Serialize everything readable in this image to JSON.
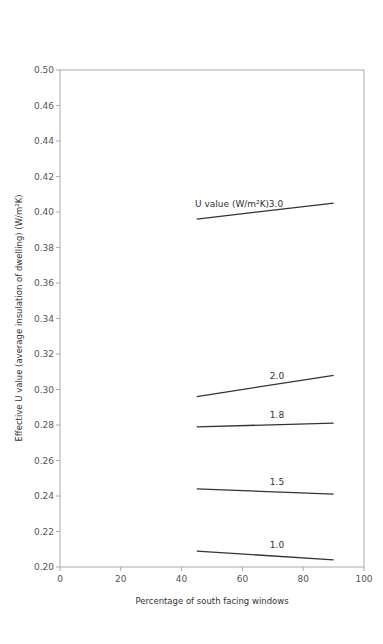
{
  "chart_data": {
    "type": "line",
    "title": "",
    "xlabel": "Percentage of south facing windows",
    "ylabel": "Effective U value (average insulation of dwelling) (W/m²K)",
    "xlim": [
      0,
      100
    ],
    "ylim": [
      0.2,
      0.48
    ],
    "x_ticks": [
      0,
      20,
      40,
      60,
      80,
      100
    ],
    "y_ticks": [
      {
        "value": 0.2,
        "label": "0.20"
      },
      {
        "value": 0.22,
        "label": "0.22"
      },
      {
        "value": 0.24,
        "label": "0.24"
      },
      {
        "value": 0.26,
        "label": "0.26"
      },
      {
        "value": 0.28,
        "label": "0.28"
      },
      {
        "value": 0.3,
        "label": "0.30"
      },
      {
        "value": 0.32,
        "label": "0.32"
      },
      {
        "value": 0.34,
        "label": "0.34"
      },
      {
        "value": 0.36,
        "label": "0.36"
      },
      {
        "value": 0.38,
        "label": "0.38"
      },
      {
        "value": 0.4,
        "label": "0.40"
      },
      {
        "value": 0.42,
        "label": "0.42"
      },
      {
        "value": 0.44,
        "label": "0.44"
      },
      {
        "value": 0.46,
        "label": "0.46"
      },
      {
        "value": 0.48,
        "label": "0.50"
      }
    ],
    "grid": false,
    "legend_title": "U value (W/m²K)",
    "series": [
      {
        "name": "3.0",
        "x": [
          45,
          90
        ],
        "values": [
          0.396,
          0.405
        ]
      },
      {
        "name": "2.0",
        "x": [
          45,
          90
        ],
        "values": [
          0.296,
          0.308
        ]
      },
      {
        "name": "1.8",
        "x": [
          45,
          90
        ],
        "values": [
          0.279,
          0.281
        ]
      },
      {
        "name": "1.5",
        "x": [
          45,
          90
        ],
        "values": [
          0.244,
          0.241
        ]
      },
      {
        "name": "1.0",
        "x": [
          45,
          90
        ],
        "values": [
          0.209,
          0.204
        ]
      }
    ],
    "colors": {
      "line": "#333333",
      "axis": "#999999",
      "text": "#555555"
    }
  }
}
